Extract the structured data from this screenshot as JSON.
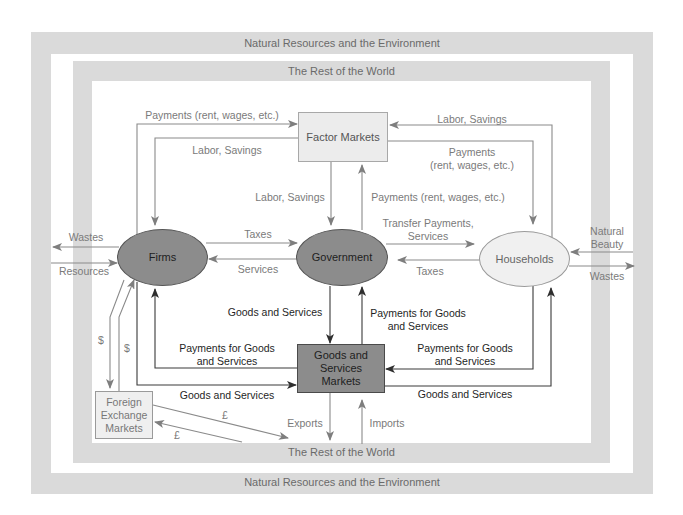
{
  "diagram": {
    "outer_frame": {
      "top_label": "Natural Resources and the Environment",
      "bottom_label": "Natural Resources and the Environment"
    },
    "inner_frame": {
      "top_label": "The Rest of the World",
      "bottom_label": "The Rest of the World"
    },
    "nodes": {
      "factor_markets": {
        "label": "Factor Markets"
      },
      "firms": {
        "label": "Firms"
      },
      "government": {
        "label": "Government"
      },
      "households": {
        "label": "Households"
      },
      "goods_services_markets": {
        "lines": [
          "Goods and",
          "Services",
          "Markets"
        ]
      },
      "foreign_exchange_markets": {
        "lines": [
          "Foreign",
          "Exchange",
          "Markets"
        ]
      }
    },
    "flows": {
      "firms_to_factor_payments": {
        "from": "Firms",
        "to": "Factor Markets",
        "lines": [
          "Payments (rent, wages, etc.)"
        ]
      },
      "factor_to_firms_labor": {
        "from": "Factor Markets",
        "to": "Firms",
        "lines": [
          "Labor, Savings"
        ]
      },
      "factor_to_government_labor": {
        "from": "Factor Markets",
        "to": "Government",
        "lines": [
          "Labor, Savings"
        ]
      },
      "government_to_factor_payments": {
        "from": "Government",
        "to": "Factor Markets",
        "lines": [
          "Payments (rent, wages, etc.)"
        ]
      },
      "households_to_factor_labor": {
        "from": "Households",
        "to": "Factor Markets",
        "lines": [
          "Labor, Savings"
        ]
      },
      "factor_to_households_payments": {
        "from": "Factor Markets",
        "to": "Households",
        "lines": [
          "Payments",
          "(rent, wages, etc.)"
        ]
      },
      "firms_wastes": {
        "from": "Firms",
        "to": "Natural Resources and the Environment",
        "lines": [
          "Wastes"
        ]
      },
      "firms_resources": {
        "from": "Natural Resources and the Environment",
        "to": "Firms",
        "lines": [
          "Resources"
        ]
      },
      "firms_to_government_taxes": {
        "from": "Firms",
        "to": "Government",
        "lines": [
          "Taxes"
        ]
      },
      "government_to_firms_services": {
        "from": "Government",
        "to": "Firms",
        "lines": [
          "Services"
        ]
      },
      "government_to_households_transfers": {
        "from": "Government",
        "to": "Households",
        "lines": [
          "Transfer Payments,",
          "Services"
        ]
      },
      "households_to_government_taxes": {
        "from": "Households",
        "to": "Government",
        "lines": [
          "Taxes"
        ]
      },
      "natural_beauty": {
        "from": "Natural Resources and the Environment",
        "to": "Households",
        "lines": [
          "Natural",
          "Beauty"
        ]
      },
      "households_wastes": {
        "from": "Households",
        "to": "Natural Resources and the Environment",
        "lines": [
          "Wastes"
        ]
      },
      "government_goods": {
        "from": "Goods and Services Markets",
        "to": "Government",
        "lines": [
          "Goods and Services"
        ]
      },
      "government_payments_goods": {
        "from": "Government",
        "to": "Goods and Services Markets",
        "lines": [
          "Payments for Goods",
          "and Services"
        ]
      },
      "firms_payments_goods": {
        "from": "Goods and Services Markets",
        "to": "Firms",
        "lines": [
          "Payments for Goods",
          "and Services"
        ]
      },
      "firms_goods": {
        "from": "Firms",
        "to": "Goods and Services Markets",
        "lines": [
          "Goods and Services"
        ]
      },
      "households_payments_goods": {
        "from": "Households",
        "to": "Goods and Services Markets",
        "lines": [
          "Payments for Goods",
          "and Services"
        ]
      },
      "households_goods": {
        "from": "Goods and Services Markets",
        "to": "Households",
        "lines": [
          "Goods and Services"
        ]
      },
      "firms_to_fx_dollar": {
        "from": "Firms",
        "to": "Foreign Exchange Markets",
        "lines": [
          "$"
        ]
      },
      "fx_to_firms_dollar": {
        "from": "Foreign Exchange Markets",
        "to": "Firms",
        "lines": [
          "$"
        ]
      },
      "fx_to_world_pound": {
        "from": "Foreign Exchange Markets",
        "to": "The Rest of the World",
        "lines": [
          "£"
        ]
      },
      "world_to_fx_pound": {
        "from": "The Rest of the World",
        "to": "Foreign Exchange Markets",
        "lines": [
          "£"
        ]
      },
      "exports": {
        "from": "Goods and Services Markets",
        "to": "The Rest of the World",
        "lines": [
          "Exports"
        ]
      },
      "imports": {
        "from": "The Rest of the World",
        "to": "Goods and Services Markets",
        "lines": [
          "Imports"
        ]
      }
    },
    "colors": {
      "band": "#dadada",
      "dark_node_fill": "#8c8c8c",
      "light_node_fill": "#eeeeee",
      "gray_flow": "#8a8a8a",
      "dark_flow": "#3a3a3a"
    }
  }
}
